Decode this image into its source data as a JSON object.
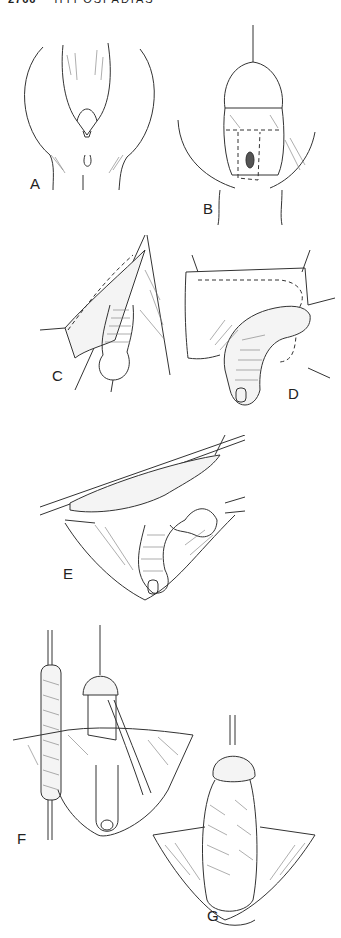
{
  "header": {
    "page_number": "2766",
    "running_title": "HYPOSPADIAS"
  },
  "figure": {
    "panels": [
      {
        "id": "A",
        "label": "A"
      },
      {
        "id": "B",
        "label": "B"
      },
      {
        "id": "C",
        "label": "C"
      },
      {
        "id": "D",
        "label": "D"
      },
      {
        "id": "E",
        "label": "E"
      },
      {
        "id": "F",
        "label": "F"
      },
      {
        "id": "G",
        "label": "G"
      }
    ]
  },
  "colors": {
    "ink": "#333333",
    "background": "#ffffff"
  }
}
